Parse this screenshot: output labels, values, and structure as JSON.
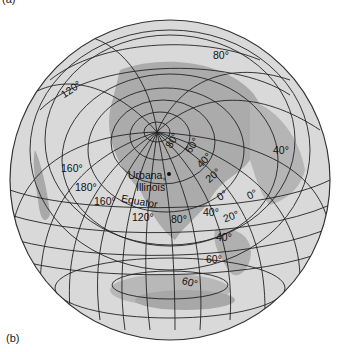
{
  "figure": {
    "panel_top_label": "(a)",
    "panel_label": "(b)",
    "location_label_line1": "Urbana,",
    "location_label_line2": "Illinois",
    "equator_label": "Equator",
    "colors": {
      "ocean": "#d9d9d9",
      "land": "#a9a9a9",
      "grid": "#222222",
      "outline": "#333333"
    }
  },
  "labels": {
    "lon_120_top": "120°",
    "lon_80_top": "80°",
    "lat_80": "80°",
    "lat_60": "60°",
    "lat_40": "40°",
    "lat_20": "20°",
    "lat_0": "0°",
    "lon_0_right": "0°",
    "lon_40_right": "40°",
    "lon_160_left": "160°",
    "lon_180": "180°",
    "lon_160_eq": "160°",
    "lon_120_eq": "120°",
    "lon_80_eq": "80°",
    "lon_40_eq": "40°",
    "lat_s20": "20°",
    "lat_s40": "40°",
    "lat_s60": "60°",
    "lat_s80": "60°"
  }
}
